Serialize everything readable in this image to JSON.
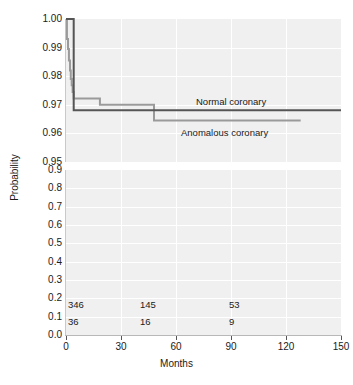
{
  "chart_data": {
    "type": "line",
    "title": "",
    "xlabel": "Months",
    "ylabel": "Probability",
    "xlim": [
      0,
      150
    ],
    "xticks": [
      0,
      30,
      60,
      90,
      120,
      150
    ],
    "broken_y_axis": true,
    "y_upper_panel": {
      "ylim": [
        0.95,
        1.0
      ],
      "yticks": [
        0.95,
        0.96,
        0.97,
        0.98,
        0.99,
        1.0
      ],
      "ytick_labels": [
        "0.95",
        "0.96",
        "0.97",
        "0.98",
        "0.99",
        "1.00"
      ]
    },
    "y_lower_panel": {
      "ylim": [
        0.0,
        0.9
      ],
      "yticks": [
        0.0,
        0.1,
        0.2,
        0.3,
        0.4,
        0.5,
        0.6,
        0.7,
        0.8,
        0.9
      ],
      "ytick_labels": [
        "0.0",
        "0.1",
        "0.2",
        "0.3",
        "0.4",
        "0.5",
        "0.6",
        "0.7",
        "0.8",
        "0.9"
      ]
    },
    "grid": true,
    "legend_position": "inline-annotation",
    "series": [
      {
        "name": "Normal coronary",
        "color": "#555555",
        "style": "step",
        "points": [
          [
            0,
            1.0
          ],
          [
            4.2,
            1.0
          ],
          [
            4.2,
            0.9681
          ],
          [
            150,
            0.9681
          ]
        ]
      },
      {
        "name": "Anomalous coronary",
        "color": "#9a9a9a",
        "style": "step",
        "points": [
          [
            0,
            1.0
          ],
          [
            0.5,
            1.0
          ],
          [
            0.5,
            0.993
          ],
          [
            1.1,
            0.993
          ],
          [
            1.1,
            0.9895
          ],
          [
            1.6,
            0.9895
          ],
          [
            1.6,
            0.9855
          ],
          [
            2.2,
            0.9855
          ],
          [
            2.2,
            0.982
          ],
          [
            2.6,
            0.982
          ],
          [
            2.6,
            0.979
          ],
          [
            3.1,
            0.979
          ],
          [
            3.1,
            0.9768
          ],
          [
            3.6,
            0.9768
          ],
          [
            3.6,
            0.9745
          ],
          [
            4.2,
            0.9745
          ],
          [
            4.2,
            0.9722
          ],
          [
            18.5,
            0.9722
          ],
          [
            18.5,
            0.97
          ],
          [
            48.0,
            0.97
          ],
          [
            48.0,
            0.9645
          ],
          [
            128.0,
            0.9645
          ]
        ]
      }
    ],
    "annotations": [
      {
        "text": "Normal coronary",
        "x": 96,
        "y": 0.9735
      },
      {
        "text": "Anomalous coronary",
        "x": 88,
        "y": 0.9605
      }
    ],
    "at_risk_table": {
      "times": [
        0,
        45,
        90
      ],
      "rows": [
        {
          "name": "Normal coronary",
          "counts": [
            "346",
            "145",
            "53"
          ]
        },
        {
          "name": "Anomalous coronary",
          "counts": [
            "36",
            "16",
            "9"
          ]
        }
      ]
    }
  },
  "axes": {
    "x_title": "Months",
    "y_title": "Probability",
    "xticks": [
      "0",
      "30",
      "60",
      "90",
      "120",
      "150"
    ],
    "yticks_top": [
      "1.00",
      "0.99",
      "0.98",
      "0.97",
      "0.96",
      "0.95"
    ],
    "yticks_bottom": [
      "0.9",
      "0.8",
      "0.7",
      "0.6",
      "0.5",
      "0.4",
      "0.3",
      "0.2",
      "0.1",
      "0.0"
    ]
  },
  "labels": {
    "normal": "Normal coronary",
    "anomalous": "Anomalous coronary"
  },
  "at_risk": {
    "normal": [
      "346",
      "145",
      "53"
    ],
    "anomalous": [
      "36",
      "16",
      "9"
    ]
  },
  "colors": {
    "normal_curve": "#555555",
    "anomalous_curve": "#9a9a9a",
    "panel_background": "#f0f0f0",
    "gridline": "#ffffff",
    "text": "#1a1a1a"
  }
}
